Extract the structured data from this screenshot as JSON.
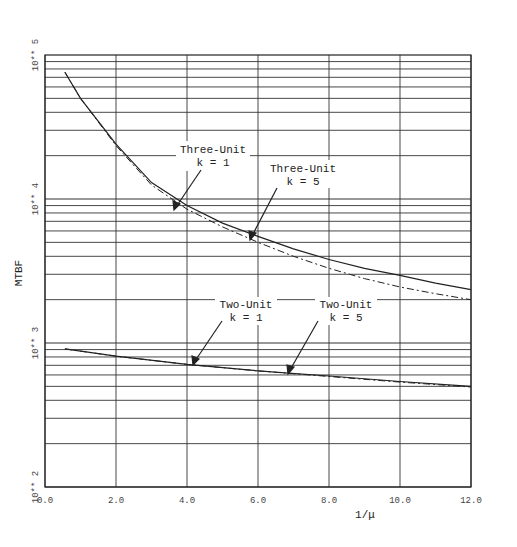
{
  "chart_data": {
    "type": "line",
    "title": "",
    "xlabel": "1/μ",
    "ylabel": "MTBF",
    "xlim": [
      0,
      12
    ],
    "ylim": [
      100,
      100000
    ],
    "yscale": "log",
    "grid": true,
    "x_ticks": [
      "0.0",
      "2.0",
      "4.0",
      "6.0",
      "8.0",
      "10.0",
      "12.0"
    ],
    "y_ticks": [
      "10** 2",
      "10** 3",
      "10** 4",
      "10** 5"
    ],
    "legend": "none (inline annotations with arrows)",
    "series": [
      {
        "name": "Three-Unit k = 1",
        "style": "solid",
        "x": [
          0.56,
          1.0,
          2.0,
          3.0,
          4.0,
          5.0,
          6.0,
          7.0,
          8.0,
          9.0,
          10.0,
          11.0,
          12.0
        ],
        "y": [
          76000,
          50000,
          24000,
          13000,
          9000,
          6800,
          5500,
          4500,
          3800,
          3300,
          2950,
          2600,
          2350
        ]
      },
      {
        "name": "Three-Unit k = 5",
        "style": "dash-dot",
        "x": [
          0.56,
          1.0,
          2.0,
          3.0,
          4.0,
          5.0,
          6.0,
          7.0,
          8.0,
          9.0,
          10.0,
          11.0,
          12.0
        ],
        "y": [
          76000,
          50000,
          23500,
          12500,
          8500,
          6400,
          5000,
          4000,
          3300,
          2800,
          2450,
          2200,
          2000
        ]
      },
      {
        "name": "Two-Unit k = 1",
        "style": "solid",
        "x": [
          0.56,
          2.0,
          4.0,
          6.0,
          8.0,
          10.0,
          12.0
        ],
        "y": [
          910,
          810,
          710,
          640,
          590,
          540,
          500
        ]
      },
      {
        "name": "Two-Unit k = 5",
        "style": "dash-dot",
        "x": [
          0.56,
          2.0,
          4.0,
          6.0,
          8.0,
          10.0,
          12.0
        ],
        "y": [
          910,
          810,
          710,
          640,
          585,
          535,
          495
        ]
      }
    ],
    "annotations": [
      {
        "text": [
          "Three-Unit",
          "k = 1"
        ],
        "points_to": [
          3.5,
          9700
        ]
      },
      {
        "text": [
          "Three-Unit",
          "k = 5"
        ],
        "points_to": [
          5.8,
          5300
        ]
      },
      {
        "text": [
          "Two-Unit",
          "k = 1"
        ],
        "points_to": [
          4.1,
          700
        ]
      },
      {
        "text": [
          "Two-Unit",
          "k = 5"
        ],
        "points_to": [
          6.8,
          620
        ]
      }
    ]
  },
  "labels": {
    "xlabel": "1/μ",
    "ylabel": "MTBF",
    "ann_3u_k1_line1": "Three-Unit",
    "ann_3u_k1_line2": "k = 1",
    "ann_3u_k5_line1": "Three-Unit",
    "ann_3u_k5_line2": "k = 5",
    "ann_2u_k1_line1": "Two-Unit",
    "ann_2u_k1_line2": "k = 1",
    "ann_2u_k5_line1": "Two-Unit",
    "ann_2u_k5_line2": "k = 5"
  }
}
